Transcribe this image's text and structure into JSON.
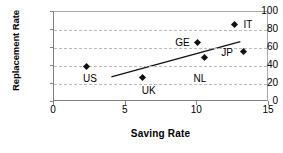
{
  "chart_data": {
    "type": "scatter",
    "title": "",
    "xlabel": "Saving Rate",
    "ylabel": "Replacement Rate",
    "xlim": [
      0,
      15
    ],
    "ylim": [
      0,
      100
    ],
    "xticks": [
      0,
      5,
      10,
      15
    ],
    "yticks": [
      0,
      20,
      40,
      60,
      80,
      100
    ],
    "xtick_labels": [
      "0",
      "5",
      "10",
      "15"
    ],
    "ytick_labels": [
      "0",
      "20",
      "40",
      "60",
      "80",
      "100"
    ],
    "grid": "horizontal-dashed",
    "legend": "none",
    "marker": "diamond",
    "marker_color": "#111111",
    "points": [
      {
        "label": "US",
        "x": 2.3,
        "y": 40,
        "label_dx": -4,
        "label_dy": 13
      },
      {
        "label": "UK",
        "x": 6.2,
        "y": 27,
        "label_dx": -1,
        "label_dy": 13
      },
      {
        "label": "GE",
        "x": 10.0,
        "y": 66,
        "label_dx": -22,
        "label_dy": 0
      },
      {
        "label": "NL",
        "x": 10.5,
        "y": 50,
        "label_dx": -11,
        "label_dy": 22
      },
      {
        "label": "JP",
        "x": 13.2,
        "y": 56,
        "label_dx": -22,
        "label_dy": 1
      },
      {
        "label": "IT",
        "x": 12.6,
        "y": 86,
        "label_dx": 9,
        "label_dy": 0
      }
    ],
    "trend_line": {
      "name": "linear fit",
      "x0": 4.0,
      "y0": 28,
      "x1": 13.0,
      "y1": 67,
      "color": "#111111"
    }
  }
}
